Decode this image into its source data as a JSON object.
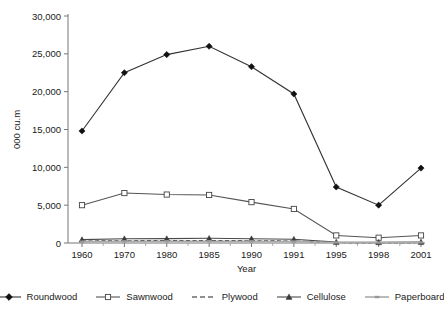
{
  "chart_data": {
    "type": "line",
    "title": "",
    "xlabel": "Year",
    "ylabel": "000 cu.m",
    "categories": [
      "1960",
      "1970",
      "1980",
      "1985",
      "1990",
      "1991",
      "1995",
      "1998",
      "2001"
    ],
    "ylim": [
      0,
      30000
    ],
    "ytick_values": [
      0,
      5000,
      10000,
      15000,
      20000,
      25000,
      30000
    ],
    "ytick_labels": [
      "0",
      "5,000",
      "10,000",
      "15,000",
      "20,000",
      "25,000",
      "30,000"
    ],
    "grid": false,
    "legend_position": "bottom",
    "series": [
      {
        "name": "Roundwood",
        "marker": "filled-diamond",
        "line": "solid",
        "color": "#333333",
        "values": [
          14800,
          22500,
          24900,
          26000,
          23300,
          19700,
          7400,
          5000,
          9900
        ]
      },
      {
        "name": "Sawnwood",
        "marker": "open-square",
        "line": "solid",
        "color": "#555555",
        "values": [
          5000,
          6600,
          6400,
          6350,
          5400,
          4500,
          1000,
          700,
          1000
        ]
      },
      {
        "name": "Plywood",
        "marker": "none",
        "line": "dashed",
        "color": "#222222",
        "values": [
          260,
          300,
          330,
          340,
          300,
          260,
          60,
          40,
          60
        ]
      },
      {
        "name": "Cellulose",
        "marker": "filled-triangle",
        "line": "solid",
        "color": "#4a4a4a",
        "values": [
          450,
          560,
          580,
          620,
          560,
          500,
          120,
          90,
          130
        ]
      },
      {
        "name": "Paperboard",
        "marker": "small-dash",
        "line": "solid",
        "color": "#aaaaaa",
        "values": [
          180,
          210,
          230,
          240,
          220,
          190,
          70,
          60,
          80
        ]
      }
    ]
  },
  "legend": {
    "items": [
      {
        "label": "Roundwood"
      },
      {
        "label": "Sawnwood"
      },
      {
        "label": "Plywood"
      },
      {
        "label": "Cellulose"
      },
      {
        "label": "Paperboard"
      }
    ]
  }
}
